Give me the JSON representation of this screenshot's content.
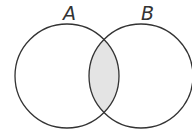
{
  "diagram": {
    "type": "venn",
    "sets": [
      {
        "label": "A",
        "cx": 67,
        "cy": 76,
        "r": 52
      },
      {
        "label": "B",
        "cx": 141,
        "cy": 76,
        "r": 52
      }
    ],
    "shaded_region": "A ∩ B",
    "shade_color": "#e4e4e4",
    "stroke_color": "#333333"
  }
}
